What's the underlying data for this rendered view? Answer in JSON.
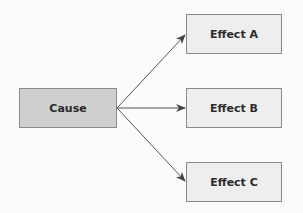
{
  "diagram": {
    "cause": {
      "label": "Cause"
    },
    "effects": [
      {
        "label": "Effect A"
      },
      {
        "label": "Effect B"
      },
      {
        "label": "Effect C"
      }
    ],
    "colors": {
      "cause_fill": "#cfcfcf",
      "effect_fill": "#eeeeee",
      "border": "#8a8a8a",
      "arrow": "#555555"
    }
  }
}
